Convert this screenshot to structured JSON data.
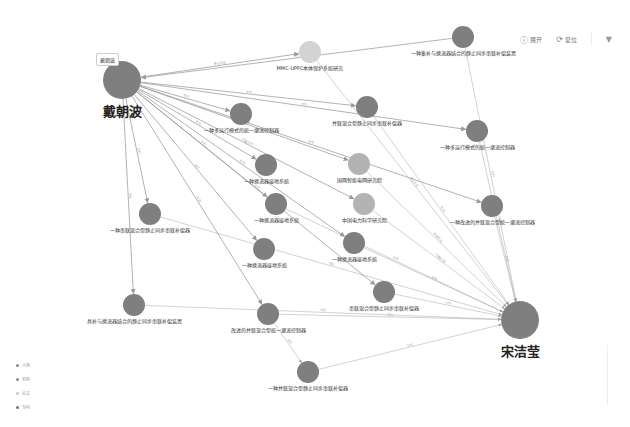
{
  "toolbar": {
    "expand_label": "展开",
    "expand_icon": "circle-info-icon",
    "reset_label": "复位",
    "reset_icon": "refresh-icon",
    "filter_icon": "filter-icon"
  },
  "tooltip": {
    "text": "戴朝波"
  },
  "legend": {
    "items": [
      {
        "label": "人物",
        "color": "#888888"
      },
      {
        "label": "机构",
        "color": "#888888"
      },
      {
        "label": "论文",
        "color": "#cccccc"
      },
      {
        "label": "专利",
        "color": "#777777"
      }
    ]
  },
  "colors": {
    "node": "#7f7f7f",
    "node_light": "#b3b3b3",
    "node_lighter": "#d3d3d3",
    "edge": "#9a9a9a"
  },
  "nodes": [
    {
      "id": "n0",
      "label": "戴朝波",
      "x": 122,
      "y": 80,
      "r": 19,
      "big": true,
      "shade": "node"
    },
    {
      "id": "n1",
      "label": "MMC-UPFC本体保护系统研究",
      "x": 310,
      "y": 52,
      "r": 11,
      "shade": "node_lighter"
    },
    {
      "id": "n2",
      "label": "一种集补与换流器结合的静止同步串联补偿装置",
      "x": 463,
      "y": 37,
      "r": 11,
      "shade": "node"
    },
    {
      "id": "n3",
      "label": "一种多运行模式的统一潮流控制器",
      "x": 241,
      "y": 114,
      "r": 11,
      "shade": "node"
    },
    {
      "id": "n4",
      "label": "并联混合型静止同步串联补偿器",
      "x": 367,
      "y": 107,
      "r": 11,
      "shade": "node"
    },
    {
      "id": "n5",
      "label": "一种多运行模式的统一潮流控制器",
      "x": 477,
      "y": 131,
      "r": 11,
      "shade": "node"
    },
    {
      "id": "n6",
      "label": "一种换流器接地系统",
      "x": 266,
      "y": 165,
      "r": 11,
      "shade": "node"
    },
    {
      "id": "n7",
      "label": "国网智能电网研究院",
      "x": 359,
      "y": 164,
      "r": 11,
      "shade": "node_light"
    },
    {
      "id": "n8",
      "label": "一种换流器接地系统",
      "x": 276,
      "y": 204,
      "r": 11,
      "shade": "node"
    },
    {
      "id": "n9",
      "label": "中国电力科学研究院",
      "x": 364,
      "y": 204,
      "r": 11,
      "shade": "node_light"
    },
    {
      "id": "n10",
      "label": "一种改进的并联混合型统一潮流控制器",
      "x": 492,
      "y": 206,
      "r": 11,
      "shade": "node"
    },
    {
      "id": "n11",
      "label": "一种串联混合型静止同步串联补偿器",
      "x": 150,
      "y": 214,
      "r": 11,
      "shade": "node"
    },
    {
      "id": "n12",
      "label": "一种换流器接地系统",
      "x": 264,
      "y": 249,
      "r": 11,
      "shade": "node"
    },
    {
      "id": "n13",
      "label": "一种换流器接地系统",
      "x": 354,
      "y": 243,
      "r": 11,
      "shade": "node"
    },
    {
      "id": "n14",
      "label": "串联混合型静止同步串联补偿器",
      "x": 384,
      "y": 292,
      "r": 11,
      "shade": "node"
    },
    {
      "id": "n15",
      "label": "具补与换流器结合的静止同步串联补偿装置",
      "x": 134,
      "y": 305,
      "r": 11,
      "shade": "node"
    },
    {
      "id": "n16",
      "label": "改进的并联混合型统一潮流控制器",
      "x": 268,
      "y": 314,
      "r": 11,
      "shade": "node"
    },
    {
      "id": "n17",
      "label": "宋洁莹",
      "x": 520,
      "y": 320,
      "r": 19,
      "big": true,
      "shade": "node"
    },
    {
      "id": "n18",
      "label": "一种并联混合型静止同步串联补偿器",
      "x": 308,
      "y": 372,
      "r": 11,
      "shade": "node"
    }
  ],
  "edges": [
    {
      "from": "n0",
      "to": "n1",
      "label": "参与项目"
    },
    {
      "from": "n2",
      "to": "n0",
      "label": "专利"
    },
    {
      "from": "n0",
      "to": "n3",
      "label": "专利"
    },
    {
      "from": "n0",
      "to": "n4",
      "label": "专利"
    },
    {
      "from": "n0",
      "to": "n5",
      "label": "专利"
    },
    {
      "from": "n0",
      "to": "n6",
      "label": "专利"
    },
    {
      "from": "n0",
      "to": "n7",
      "label": "所属机构"
    },
    {
      "from": "n0",
      "to": "n8",
      "label": "专利"
    },
    {
      "from": "n0",
      "to": "n9",
      "label": "所属机构"
    },
    {
      "from": "n0",
      "to": "n10",
      "label": "专利"
    },
    {
      "from": "n0",
      "to": "n11",
      "label": "专利"
    },
    {
      "from": "n0",
      "to": "n12",
      "label": "专利"
    },
    {
      "from": "n0",
      "to": "n13",
      "label": "专利"
    },
    {
      "from": "n0",
      "to": "n14",
      "label": "专利"
    },
    {
      "from": "n0",
      "to": "n15",
      "label": "专利"
    },
    {
      "from": "n0",
      "to": "n16",
      "label": "专利"
    },
    {
      "from": "n16",
      "to": "n18",
      "label": "专利"
    },
    {
      "from": "n1",
      "to": "n17",
      "label": "参与项目"
    },
    {
      "from": "n2",
      "to": "n17",
      "label": "专利"
    },
    {
      "from": "n4",
      "to": "n17",
      "label": "专利"
    },
    {
      "from": "n5",
      "to": "n17",
      "label": "专利"
    },
    {
      "from": "n7",
      "to": "n17",
      "label": "所属机构"
    },
    {
      "from": "n9",
      "to": "n17",
      "label": "所属机构"
    },
    {
      "from": "n10",
      "to": "n17",
      "label": "专利"
    },
    {
      "from": "n11",
      "to": "n17",
      "label": "专利"
    },
    {
      "from": "n13",
      "to": "n17",
      "label": "专利"
    },
    {
      "from": "n14",
      "to": "n17",
      "label": "专利"
    },
    {
      "from": "n15",
      "to": "n17",
      "label": "专利"
    },
    {
      "from": "n16",
      "to": "n17",
      "label": "专利"
    },
    {
      "from": "n18",
      "to": "n17",
      "label": "专利"
    },
    {
      "from": "n8",
      "to": "n17",
      "label": "专利"
    }
  ]
}
